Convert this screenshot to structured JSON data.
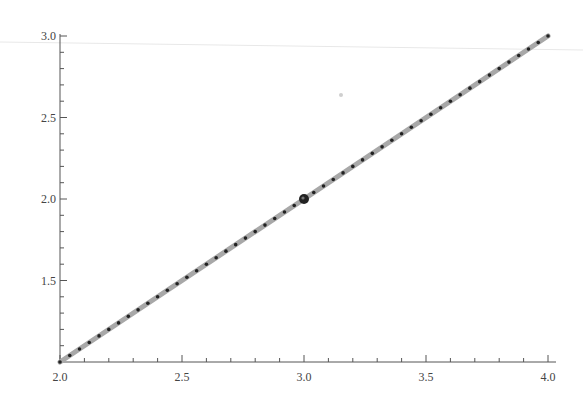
{
  "chart_data": {
    "type": "line",
    "title": "",
    "xlabel": "",
    "ylabel": "",
    "xlim": [
      2.0,
      4.0
    ],
    "ylim": [
      1.0,
      3.0
    ],
    "grid": false,
    "legend": null,
    "x_ticks": {
      "major": [
        2.0,
        2.5,
        3.0,
        3.5,
        4.0
      ],
      "major_labels": [
        "2.0",
        "2.5",
        "3.0",
        "3.5",
        "4.0"
      ],
      "minor_step": 0.1
    },
    "y_ticks": {
      "major": [
        1.5,
        2.0,
        2.5,
        3.0
      ],
      "major_labels": [
        "1.5",
        "2.0",
        "2.5",
        "3.0"
      ],
      "minor_step": 0.1
    },
    "series": [
      {
        "name": "line",
        "style": "thick gray line with black dots",
        "line_color": "#a8a8a8",
        "marker_color": "#222222",
        "equation": "y = x - 1",
        "x_start": 2.0,
        "x_end": 4.0,
        "x_step": 0.04,
        "endpoints": [
          [
            2.0,
            1.0
          ],
          [
            4.0,
            3.0
          ]
        ]
      }
    ],
    "annotations": [
      {
        "type": "highlighted-point",
        "x": 3.0,
        "y": 2.0,
        "color": "#222222"
      }
    ]
  },
  "colors": {
    "background": "#ffffff",
    "axis": "#555555",
    "tick_label": "#444444",
    "line": "#a8a8a8",
    "marker": "#222222",
    "scan_artifact": "#e6e6e6"
  }
}
